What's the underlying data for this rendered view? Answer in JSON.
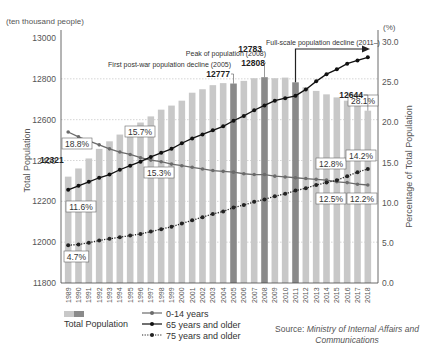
{
  "chart_data": {
    "type": "bar+line",
    "title": "",
    "left_axis": {
      "unit_label": "(ten thousand people)",
      "label": "Total Population",
      "ticks": [
        11800,
        12000,
        12200,
        12400,
        12600,
        12800,
        13000
      ],
      "range": [
        11800,
        13000
      ]
    },
    "right_axis": {
      "unit_label": "(%)",
      "label": "Percentage of Total Population",
      "ticks": [
        "0.0",
        "5.0",
        "10.0",
        "15.0",
        "20.0",
        "25.0",
        "30.0"
      ],
      "range": [
        0,
        30
      ]
    },
    "categories": [
      "1989",
      "1990",
      "1991",
      "1992",
      "1993",
      "1994",
      "1995",
      "1996",
      "1997",
      "1998",
      "1999",
      "2000",
      "2001",
      "2002",
      "2003",
      "2004",
      "2005",
      "2006",
      "2007",
      "2008",
      "2009",
      "2010",
      "2011",
      "2012",
      "2013",
      "2014",
      "2015",
      "2016",
      "2017",
      "2018"
    ],
    "bars": {
      "name": "Total Population",
      "values": [
        12321,
        12361,
        12410,
        12457,
        12494,
        12527,
        12557,
        12586,
        12616,
        12649,
        12669,
        12693,
        12732,
        12749,
        12769,
        12779,
        12777,
        12790,
        12803,
        12808,
        12803,
        12806,
        12783,
        12759,
        12741,
        12724,
        12709,
        12693,
        12671,
        12644
      ],
      "highlight_years": [
        "2005",
        "2008",
        "2011"
      ],
      "color": "#c8c8c8",
      "highlight_color": "#8a8a8a"
    },
    "series": [
      {
        "name": "0-14 years",
        "style": "solid-gray",
        "values": [
          18.8,
          18.2,
          17.7,
          17.2,
          16.7,
          16.3,
          16.0,
          15.6,
          15.3,
          15.1,
          14.8,
          14.6,
          14.4,
          14.2,
          14.0,
          13.9,
          13.8,
          13.6,
          13.5,
          13.5,
          13.3,
          13.2,
          13.1,
          13.0,
          12.9,
          12.8,
          12.6,
          12.5,
          12.3,
          12.2
        ]
      },
      {
        "name": "65 years and older",
        "style": "solid-black",
        "values": [
          11.6,
          12.1,
          12.6,
          13.1,
          13.5,
          14.1,
          14.6,
          15.1,
          15.7,
          16.2,
          16.7,
          17.4,
          18.0,
          18.5,
          19.0,
          19.5,
          20.2,
          20.8,
          21.5,
          22.1,
          22.7,
          23.0,
          23.3,
          24.1,
          25.1,
          26.0,
          26.6,
          27.3,
          27.7,
          28.1
        ]
      },
      {
        "name": "75 years and older",
        "style": "dotted-black",
        "values": [
          4.7,
          4.8,
          5.0,
          5.3,
          5.5,
          5.7,
          5.9,
          6.1,
          6.4,
          6.7,
          7.0,
          7.4,
          7.8,
          8.2,
          8.6,
          8.9,
          9.4,
          9.7,
          10.1,
          10.4,
          10.8,
          11.1,
          11.5,
          11.8,
          12.2,
          12.5,
          12.8,
          13.3,
          13.8,
          14.2
        ]
      }
    ],
    "annotations": [
      {
        "text": "Peak of population (2008)",
        "value": "12808"
      },
      {
        "text": "First post-war population decline (2005)",
        "value": "12777"
      },
      {
        "text": "Full-scale population decline (2011–)",
        "value": "12783"
      },
      {
        "value": "12644"
      },
      {
        "value": "12321"
      }
    ],
    "data_labels": [
      "18.8%",
      "15.7%",
      "15.3%",
      "11.6%",
      "4.7%",
      "28.1%",
      "12.8%",
      "12.5%",
      "14.2%",
      "12.2%"
    ],
    "legend": [
      "Total Population",
      "0-14 years",
      "65 years and older",
      "75 years and older"
    ],
    "grid": "dotted horizontal"
  },
  "labels": {
    "left_unit": "(ten thousand people)",
    "right_unit": "(%)",
    "left_axis_title": "Total Population",
    "right_axis_title": "Percentage of Total Population",
    "ann_peak": "Peak of population (2008)",
    "ann_peak_val": "12808",
    "ann_first": "First post-war population decline (2005)",
    "ann_first_val": "12777",
    "ann_full": "Full-scale population decline (2011–)",
    "ann_full_val": "12783",
    "ann_last_val": "12644",
    "ann_first_year_val": "12321",
    "legend_total": "Total Population",
    "legend_014": "0-14 years",
    "legend_65": "65 years and older",
    "legend_75": "75 years and older",
    "source_prefix": "Source: ",
    "source_text": "Ministry of Internal Affairs and Communications"
  }
}
